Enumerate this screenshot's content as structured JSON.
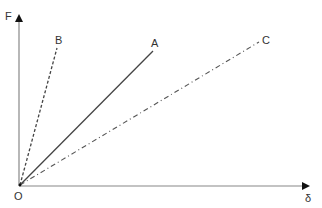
{
  "diagram": {
    "type": "force-displacement line diagram",
    "axes": {
      "y_label": "F",
      "x_label": "δ",
      "origin_label": "O"
    },
    "lines": [
      {
        "label": "A",
        "style": "solid",
        "end": [
          153,
          51
        ]
      },
      {
        "label": "B",
        "style": "dashed",
        "end": [
          57,
          48
        ]
      },
      {
        "label": "C",
        "style": "dash-dot",
        "end": [
          259,
          42
        ]
      }
    ],
    "colors": {
      "axis": "#777777",
      "line": "#444444",
      "text": "#333333"
    }
  }
}
